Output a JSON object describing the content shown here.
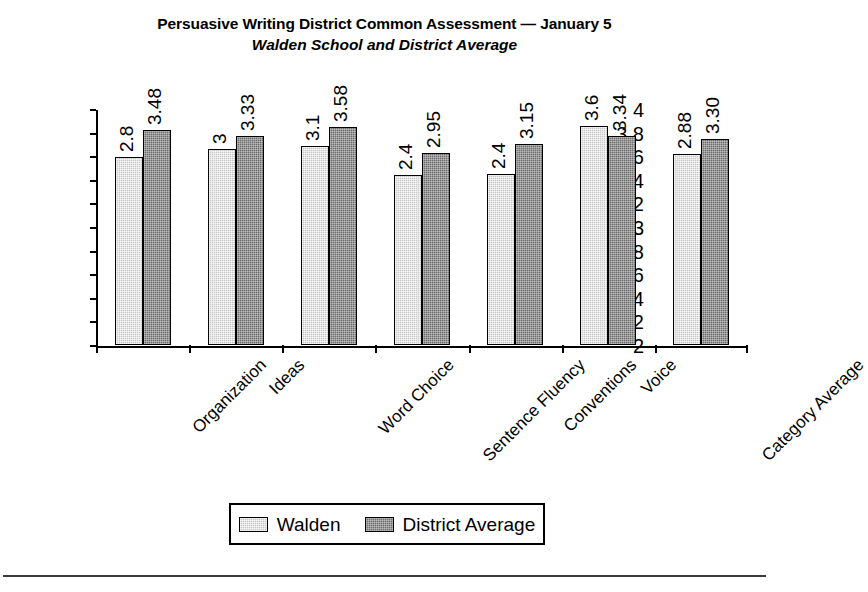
{
  "title": {
    "main": "Persuasive Writing District Common Assessment — January 5",
    "sub": "Walden School and District Average"
  },
  "legend": {
    "walden_label": "Walden",
    "district_label": "District Average",
    "walden_color": "#c9c9c9",
    "district_color": "#6f6f6f"
  },
  "chart_data": {
    "type": "bar",
    "title": "Persuasive Writing District Common Assessment — January 5",
    "subtitle": "Walden School and District Average",
    "xlabel": "",
    "ylabel": "",
    "ylim": [
      2,
      4
    ],
    "ytick_labels": [
      "4",
      "3.8",
      "3.6",
      "3.4",
      "3.2",
      "3",
      "2.8",
      "2.6",
      "2.4",
      "2.2",
      "2"
    ],
    "ytick_values": [
      4,
      3.8,
      3.6,
      3.4,
      3.2,
      3,
      2.8,
      2.6,
      2.4,
      2.2,
      2
    ],
    "grid": false,
    "legend_position": "bottom",
    "categories": [
      "Organization",
      "Ideas",
      "Word Choice",
      "Sentence Fluency",
      "Conventions",
      "Voice",
      "Category Average"
    ],
    "series": [
      {
        "name": "Walden",
        "color": "#c9c9c9",
        "values": [
          3.59,
          3.66,
          3.69,
          3.44,
          3.45,
          3.86,
          3.62
        ],
        "labels": [
          "2.8",
          "3",
          "3.1",
          "2.4",
          "2.4",
          "3.6",
          "2.88"
        ]
      },
      {
        "name": "District Average",
        "color": "#6f6f6f",
        "values": [
          3.82,
          3.77,
          3.85,
          3.63,
          3.7,
          3.77,
          3.75
        ],
        "labels": [
          "3.48",
          "3.33",
          "3.58",
          "2.95",
          "3.15",
          "3.34",
          "3.30"
        ]
      }
    ]
  }
}
